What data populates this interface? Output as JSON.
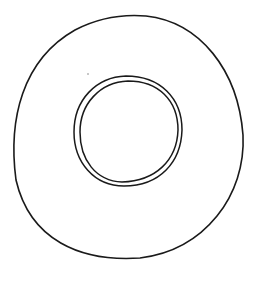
{
  "drawing": {
    "subject": "ring-sketch",
    "stroke_color": "#1a1a1a",
    "background": "#ffffff",
    "outer_ring": {
      "cx": 128,
      "cy": 138,
      "rx": 116,
      "ry": 122
    },
    "inner_ring_outer": {
      "cx": 128,
      "cy": 131,
      "rx": 54,
      "ry": 55
    },
    "inner_ring_inner": {
      "cx": 129,
      "cy": 131,
      "rx": 49,
      "ry": 51
    }
  }
}
